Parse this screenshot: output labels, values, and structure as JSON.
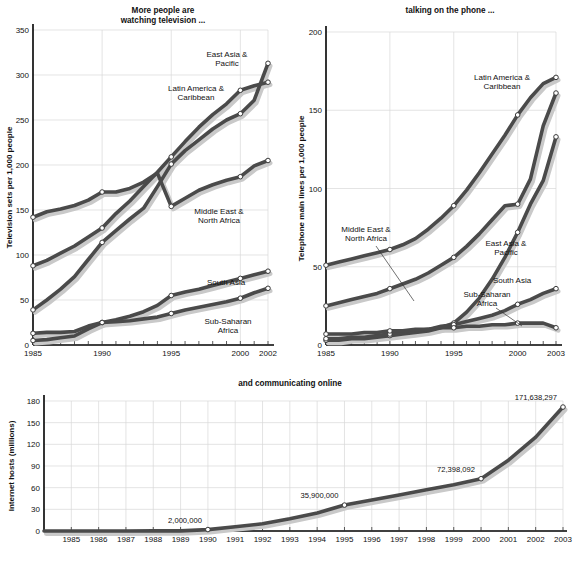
{
  "figure": {
    "panels": [
      "tv",
      "phone",
      "net"
    ]
  },
  "chart_data": [
    {
      "id": "tv",
      "type": "line",
      "title": "More people are\nwatching television ...",
      "title_line1": "More people are",
      "title_line2": "watching television ...",
      "xlabel": "",
      "ylabel": "Television sets  per 1,000 people",
      "xlim": [
        1985,
        2002
      ],
      "ylim": [
        0,
        350
      ],
      "yticks": [
        0,
        50,
        100,
        150,
        200,
        250,
        300,
        350
      ],
      "xticks": [
        1985,
        1990,
        1995,
        2000,
        2002
      ],
      "grid": true,
      "legend_position": "inline-annotations",
      "x": [
        1985,
        1986,
        1987,
        1988,
        1989,
        1990,
        1991,
        1992,
        1993,
        1994,
        1995,
        1996,
        1997,
        1998,
        1999,
        2000,
        2001,
        2002
      ],
      "series": [
        {
          "name": "East Asia & Pacific",
          "label_line1": "East Asia &",
          "label_line2": "Pacific",
          "color": "#4a4a4a",
          "values": [
            39,
            50,
            62,
            76,
            95,
            114,
            127,
            140,
            152,
            176,
            201,
            216,
            228,
            240,
            250,
            257,
            272,
            313
          ],
          "markers": [
            1985,
            1990,
            1995,
            2000,
            2002
          ]
        },
        {
          "name": "Latin America & Caribbean",
          "label_line1": "Latin America &",
          "label_line2": "Caribbean",
          "color": "#4a4a4a",
          "values": [
            88,
            94,
            102,
            110,
            120,
            130,
            146,
            160,
            176,
            192,
            209,
            226,
            242,
            256,
            268,
            283,
            288,
            292
          ],
          "markers": [
            1985,
            1990,
            1995,
            2000,
            2002
          ]
        },
        {
          "name": "Middle East & North Africa",
          "label_line1": "Middle East &",
          "label_line2": "North Africa",
          "color": "#4a4a4a",
          "values": [
            142,
            148,
            151,
            155,
            161,
            170,
            170,
            174,
            181,
            191,
            154,
            163,
            172,
            178,
            183,
            187,
            199,
            205
          ],
          "values_actual": [
            142,
            148,
            151,
            155,
            161,
            170,
            170,
            174,
            181,
            191,
            154,
            163,
            172,
            178,
            183,
            187,
            199,
            205
          ],
          "markers": [
            1985,
            1990,
            1995,
            2000,
            2002
          ]
        },
        {
          "name": "South Asia",
          "label_line1": "South Asia",
          "label_line2": "",
          "color": "#b4b4b4",
          "values": [
            5,
            6,
            8,
            10,
            18,
            25,
            28,
            32,
            37,
            44,
            55,
            59,
            62,
            66,
            70,
            74,
            78,
            82
          ],
          "markers": [
            1985,
            1990,
            1995,
            2000,
            2002
          ]
        },
        {
          "name": "Sub-Saharan Africa",
          "label_line1": "Sub-Saharan",
          "label_line2": "Africa",
          "color": "#4a4a4a",
          "values": [
            13,
            14,
            14,
            15,
            21,
            25,
            26,
            27,
            29,
            31,
            35,
            39,
            42,
            45,
            48,
            52,
            58,
            63
          ],
          "markers": [
            1985,
            1990,
            1995,
            2000,
            2002
          ]
        }
      ]
    },
    {
      "id": "phone",
      "type": "line",
      "title": "talking on the phone ...",
      "title_line1": "talking on the phone ...",
      "title_line2": "",
      "xlabel": "",
      "ylabel": "Telephone main lines  per 1,000 people",
      "xlim": [
        1985,
        2003
      ],
      "ylim": [
        0,
        200
      ],
      "yticks": [
        0,
        50,
        100,
        150,
        200
      ],
      "xticks": [
        1985,
        1990,
        1995,
        2000,
        2003
      ],
      "grid": true,
      "legend_position": "inline-annotations",
      "x": [
        1985,
        1986,
        1987,
        1988,
        1989,
        1990,
        1991,
        1992,
        1993,
        1994,
        1995,
        1996,
        1997,
        1998,
        1999,
        2000,
        2001,
        2002,
        2003
      ],
      "series": [
        {
          "name": "Latin America & Caribbean",
          "label_line1": "Latin America &",
          "label_line2": "Caribbean",
          "color": "#4a4a4a",
          "values": [
            51,
            53,
            55,
            57,
            59,
            61,
            64,
            68,
            74,
            81,
            89,
            99,
            110,
            122,
            134,
            147,
            158,
            167,
            171
          ],
          "markers": [
            1985,
            1990,
            1995,
            2000,
            2003
          ]
        },
        {
          "name": "Middle East & North Africa",
          "label_line1": "Middle East &",
          "label_line2": "North Africa",
          "color": "#4a4a4a",
          "values": [
            25,
            27,
            29,
            31,
            33,
            36,
            39,
            42,
            46,
            51,
            56,
            63,
            71,
            80,
            89,
            90,
            106,
            140,
            161
          ],
          "markers": [
            1985,
            1990,
            1995,
            2000,
            2003
          ]
        },
        {
          "name": "East Asia & Pacific",
          "label_line1": "East Asia &",
          "label_line2": "Pacific",
          "color": "#4a4a4a",
          "values": [
            3,
            3,
            4,
            4,
            5,
            6,
            7,
            8,
            9,
            11,
            14,
            21,
            30,
            42,
            56,
            72,
            90,
            105,
            133
          ],
          "markers": [
            1985,
            1990,
            1995,
            2000,
            2003
          ]
        },
        {
          "name": "South Asia",
          "label_line1": "South Asia",
          "label_line2": "",
          "color": "#b4b4b4",
          "values": [
            4,
            4,
            5,
            5,
            6,
            7,
            8,
            9,
            10,
            12,
            13,
            15,
            17,
            19,
            22,
            26,
            29,
            33,
            36
          ],
          "markers": [
            1985,
            1990,
            1995,
            2000,
            2003
          ]
        },
        {
          "name": "Sub-Saharan Africa",
          "label_line1": "Sub-Saharan",
          "label_line2": "Africa",
          "color": "#5a5a5a",
          "values": [
            7,
            7,
            7,
            8,
            8,
            9,
            9,
            10,
            10,
            11,
            11,
            12,
            12,
            13,
            13,
            14,
            14,
            14,
            11
          ],
          "markers": [
            1985,
            1990,
            1995,
            2000,
            2003
          ]
        }
      ]
    },
    {
      "id": "net",
      "type": "line",
      "title": "and communicating online",
      "title_line1": "and communicating online",
      "title_line2": "",
      "xlabel": "",
      "ylabel": "Internet hosts (millions)",
      "xlim": [
        1984,
        2003
      ],
      "ylim": [
        0,
        180
      ],
      "yticks": [
        0,
        30,
        60,
        90,
        120,
        150,
        180
      ],
      "xticks": [
        1985,
        1986,
        1987,
        1988,
        1989,
        1990,
        1991,
        1992,
        1993,
        1994,
        1995,
        1996,
        1997,
        1998,
        1999,
        2000,
        2001,
        2002,
        2003
      ],
      "grid": true,
      "legend_position": "none",
      "x": [
        1984,
        1985,
        1986,
        1987,
        1988,
        1989,
        1990,
        1991,
        1992,
        1993,
        1994,
        1995,
        1996,
        1997,
        1998,
        1999,
        2000,
        2001,
        2002,
        2003
      ],
      "series": [
        {
          "name": "Internet hosts",
          "label_line1": "",
          "label_line2": "",
          "color": "#4a4a4a",
          "values": [
            0.001,
            0.002,
            0.005,
            0.03,
            0.08,
            0.16,
            2.0,
            6.0,
            10.0,
            17.0,
            25.0,
            35.9,
            43.0,
            50.0,
            57.0,
            64.0,
            72.398,
            98.0,
            130.0,
            171.638
          ],
          "markers": [
            1990,
            1995,
            2000,
            2003
          ]
        }
      ],
      "annotations": [
        {
          "year": 1990,
          "value": 2.0,
          "text": "2,000,000"
        },
        {
          "year": 1995,
          "value": 35.9,
          "text": "35,900,000"
        },
        {
          "year": 2000,
          "value": 72.398,
          "text": "72,398,092"
        },
        {
          "year": 2003,
          "value": 171.638,
          "text": "171,638,297"
        }
      ]
    }
  ],
  "colors": {
    "line_dark": "#4a4a4a",
    "line_light": "#b4b4b4",
    "shadow": "#c9c9c9",
    "grid": "#d8d8d8",
    "axis": "#000000",
    "text": "#111111",
    "background": "#ffffff"
  }
}
